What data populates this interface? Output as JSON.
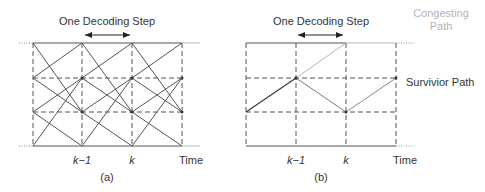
{
  "panels": [
    {
      "id": "a",
      "caption": "(a)",
      "title": "One Decoding Step",
      "x_labels": [
        "k−1",
        "k",
        "Time"
      ]
    },
    {
      "id": "b",
      "caption": "(b)",
      "title": "One Decoding Step",
      "x_labels": [
        "k−1",
        "k",
        "Time"
      ],
      "annotations": {
        "congesting_line1": "Congesting",
        "congesting_line2": "Path",
        "survivor": "Survivior Path"
      }
    }
  ],
  "colors": {
    "line": "#444444",
    "light_line": "#b0b0b0",
    "dashed": "#555555"
  }
}
